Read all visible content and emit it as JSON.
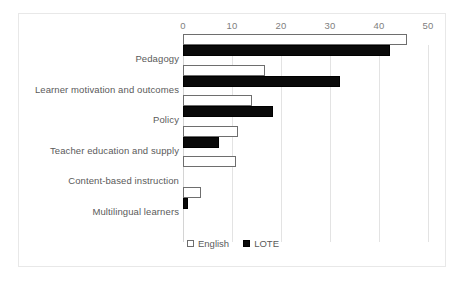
{
  "chart_data": {
    "type": "bar",
    "orientation": "horizontal",
    "title": "",
    "subtitle": "",
    "xlabel": "",
    "ylabel": "",
    "xlim": [
      0,
      50
    ],
    "ylim": null,
    "xticks": [
      0,
      10,
      20,
      30,
      40,
      50
    ],
    "xtick_labels": [
      "0",
      "10",
      "20",
      "30",
      "40",
      "50"
    ],
    "grid": true,
    "grid_axis": "x",
    "axis_position": "top",
    "legend_position": "bottom",
    "categories": [
      "Pedagogy",
      "Learner motivation and outcomes",
      "Policy",
      "Teacher education and supply",
      "Content-based instruction",
      "Multilingual learners"
    ],
    "series": [
      {
        "name": "English",
        "pattern": "dotted-light",
        "color": "#ffffff",
        "edge_color": "#6e6e6e",
        "values": [
          45.7,
          16.7,
          14.0,
          11.2,
          10.9,
          3.7
        ]
      },
      {
        "name": "LOTE",
        "pattern": "dotted-dark",
        "color": "#0a0a0a",
        "edge_color": "#000000",
        "values": [
          42.2,
          32.0,
          18.4,
          7.3,
          0.0,
          1.0
        ]
      }
    ],
    "annotations": []
  },
  "legend": {
    "items": [
      {
        "label": "English",
        "swatch": "english-swatch"
      },
      {
        "label": "LOTE",
        "swatch": "lote-swatch"
      }
    ]
  },
  "colors": {
    "frame_border": "#e8e8e8",
    "gridline": "#e3e3e3",
    "axis_line": "#d4d4d4",
    "tick_text": "#808080",
    "category_text": "#5a5a5a",
    "background": "#ffffff"
  }
}
